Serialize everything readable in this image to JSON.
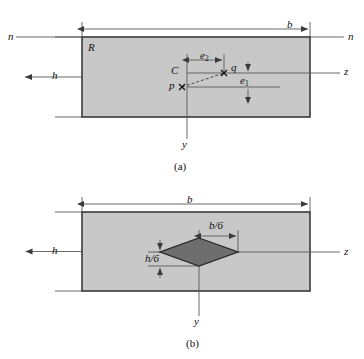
{
  "figure": {
    "background_color": "#ffffff",
    "section_fill": "#c8c8c8",
    "section_stroke": "#3a3a3a",
    "kern_fill": "#6e6e6e",
    "kern_stroke": "#262626",
    "line_color": "#5a5a5a",
    "text_color": "#111111"
  },
  "panel_a": {
    "caption": "(a)",
    "width_label": "b",
    "height_label": "h",
    "section_label": "R",
    "neutral_axis_left_label": "n",
    "neutral_axis_right_label": "n",
    "z_axis_label": "z",
    "y_axis_label": "y",
    "centroid_label": "C",
    "load_point_label": "p",
    "kern_point_label": "q",
    "e1_label": "e",
    "e1_subscript": "1",
    "e2_label": "e",
    "e2_subscript": "2"
  },
  "panel_b": {
    "caption": "(b)",
    "width_label": "b",
    "height_label": "h",
    "z_axis_label": "z",
    "y_axis_label": "y",
    "kern_width_label": "b/6",
    "kern_height_label": "h/6"
  }
}
